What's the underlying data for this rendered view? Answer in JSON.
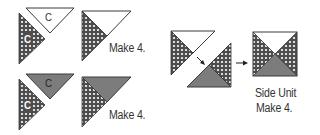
{
  "colors": {
    "checker_base": "#4d4d4d",
    "checker_dot": "#ffffff",
    "medium_gray": "#7c7c7c",
    "outline": "#3a3a3a",
    "white": "#ffffff"
  },
  "row1": {
    "piece_label_top": "C",
    "piece_label_left": "C",
    "result_label": "Make 4."
  },
  "row2": {
    "piece_label_top": "C",
    "piece_label_left": "C",
    "result_label": "Make 4."
  },
  "side_unit": {
    "title": "Side Unit",
    "count": "Make 4.",
    "arrow_icon": "arrow-right"
  }
}
